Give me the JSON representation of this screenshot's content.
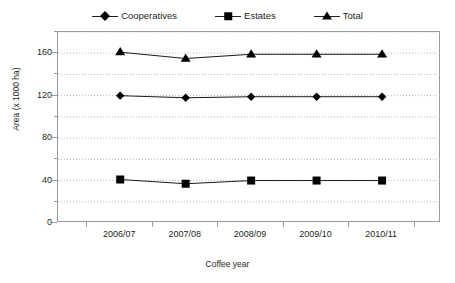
{
  "chart_data": {
    "type": "line",
    "title": "",
    "xlabel": "Coffee year",
    "ylabel": "Area (x 1000 ha)",
    "categories": [
      "2006/07",
      "2007/08",
      "2008/09",
      "2009/10",
      "2010/11"
    ],
    "series": [
      {
        "name": "Cooperatives",
        "marker": "diamond",
        "values": [
          120,
          118,
          119,
          119,
          119
        ]
      },
      {
        "name": "Estates",
        "marker": "square",
        "values": [
          41,
          37,
          40,
          40,
          40
        ]
      },
      {
        "name": "Total",
        "marker": "triangle",
        "values": [
          161,
          155,
          159,
          159,
          159
        ]
      }
    ],
    "ylim": [
      0,
      180
    ],
    "yticks": [
      0,
      40,
      80,
      120,
      160
    ],
    "yticks_minor": [
      20,
      60,
      100,
      140,
      180
    ],
    "grid": "horizontal-dotted",
    "legend_position": "top-center",
    "colors": {
      "series": "#000000",
      "axis": "#9a9a9a",
      "grid": "#b5b5b5",
      "text": "#231f20"
    }
  },
  "legend": {
    "items": [
      {
        "label": "Cooperatives",
        "marker": "diamond"
      },
      {
        "label": "Estates",
        "marker": "square"
      },
      {
        "label": "Total",
        "marker": "triangle"
      }
    ]
  },
  "axes": {
    "y_title": "Area (x 1000 ha)",
    "x_title": "Coffee year",
    "y_tick_labels": [
      "160",
      "120",
      "80",
      "40",
      "0"
    ],
    "x_tick_labels": [
      "2006/07",
      "2007/08",
      "2008/09",
      "2009/10",
      "2010/11"
    ]
  }
}
